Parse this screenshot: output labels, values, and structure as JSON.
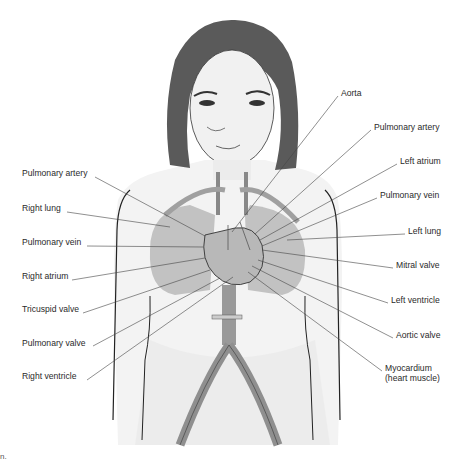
{
  "diagram": {
    "labels_left": [
      {
        "id": "pulmonary-artery-left",
        "text": "Pulmonary artery",
        "x": 22,
        "y": 173
      },
      {
        "id": "right-lung",
        "text": "Right lung",
        "x": 22,
        "y": 208
      },
      {
        "id": "pulmonary-vein-left",
        "text": "Pulmonary vein",
        "x": 22,
        "y": 242
      },
      {
        "id": "right-atrium",
        "text": "Right atrium",
        "x": 22,
        "y": 276
      },
      {
        "id": "tricuspid-valve",
        "text": "Tricuspid valve",
        "x": 22,
        "y": 309
      },
      {
        "id": "pulmonary-valve",
        "text": "Pulmonary valve",
        "x": 22,
        "y": 343
      },
      {
        "id": "right-ventricle",
        "text": "Right ventricle",
        "x": 22,
        "y": 376
      }
    ],
    "labels_right": [
      {
        "id": "aorta",
        "text": "Aorta",
        "x": 341,
        "y": 92
      },
      {
        "id": "pulmonary-artery-right",
        "text": "Pulmonary artery",
        "x": 374,
        "y": 126
      },
      {
        "id": "left-atrium",
        "text": "Left atrium",
        "x": 400,
        "y": 160
      },
      {
        "id": "pulmonary-vein-right",
        "text": "Pulmonary vein",
        "x": 380,
        "y": 194
      },
      {
        "id": "left-lung",
        "text": "Left lung",
        "x": 408,
        "y": 230
      },
      {
        "id": "mitral-valve",
        "text": "Mitral valve",
        "x": 396,
        "y": 264
      },
      {
        "id": "left-ventricle",
        "text": "Left ventricle",
        "x": 391,
        "y": 299
      },
      {
        "id": "aortic-valve",
        "text": "Aortic valve",
        "x": 396,
        "y": 334
      },
      {
        "id": "myocardium",
        "text": "Myocardium\n(heart muscle)",
        "x": 385,
        "y": 367
      }
    ],
    "corner_text": "n."
  },
  "colors": {
    "hair": "#5a5a5a",
    "skin": "#f1f1f1",
    "lung": "#c2c2c2",
    "vessel": "#8f8f8f",
    "outline": "#222222",
    "leader": "#444444"
  }
}
